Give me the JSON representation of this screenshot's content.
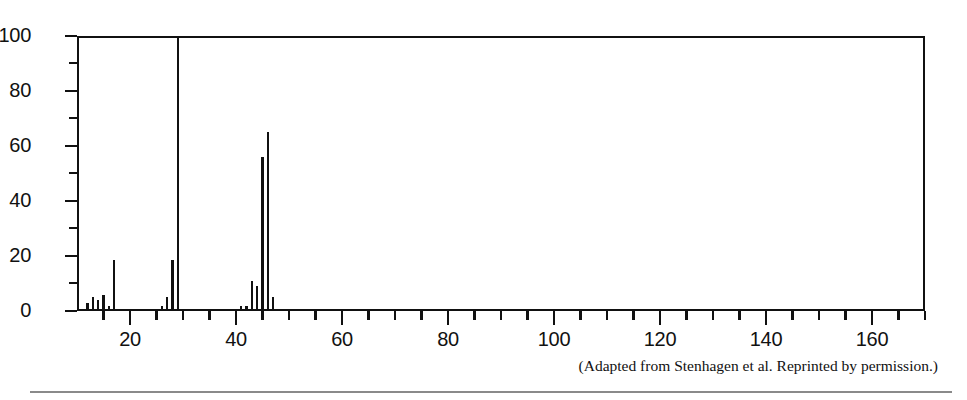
{
  "figure": {
    "caption": "(Adapted from Stenhagen et al. Reprinted by permission.)"
  },
  "chart_data": {
    "type": "bar",
    "title": "",
    "xlabel": "",
    "ylabel": "",
    "xlim": [
      10,
      170
    ],
    "ylim": [
      0,
      100
    ],
    "grid": false,
    "legend": null,
    "x_major_step": 20,
    "x_minor_step": 5,
    "y_major_step": 20,
    "y_minor_step": 10,
    "x_tick_labels": [
      "20",
      "40",
      "60",
      "80",
      "100",
      "120",
      "140",
      "160"
    ],
    "x_tick_values": [
      20,
      40,
      60,
      80,
      100,
      120,
      140,
      160
    ],
    "y_tick_labels": [
      "0",
      "20",
      "40",
      "60",
      "80",
      "100"
    ],
    "y_tick_values": [
      0,
      20,
      40,
      60,
      80,
      100
    ],
    "x": [
      12,
      13,
      14,
      15,
      16,
      17,
      26,
      27,
      28,
      29,
      41,
      42,
      43,
      44,
      45,
      46,
      47
    ],
    "values": [
      3,
      5,
      4,
      6,
      2,
      18.5,
      2,
      5,
      18.5,
      100,
      2,
      2,
      11,
      9,
      56,
      65,
      5
    ],
    "categories": [
      "12",
      "13",
      "14",
      "15",
      "16",
      "17",
      "26",
      "27",
      "28",
      "29",
      "41",
      "42",
      "43",
      "44",
      "45",
      "46",
      "47"
    ],
    "base_peak_mz": 29,
    "base_peak_value": 100
  }
}
